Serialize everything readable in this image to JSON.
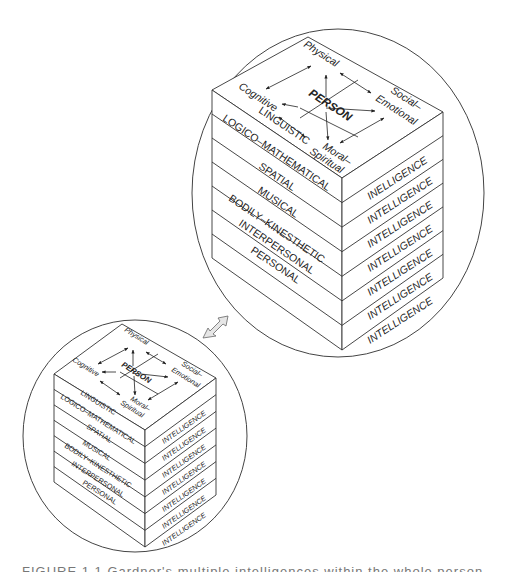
{
  "figure": {
    "layers": [
      "LINGUISTIC",
      "LOGICO–MATHEMATICAL",
      "SPATIAL",
      "MUSICAL",
      "BODILY–KINESTHETIC",
      "INTERPERSONAL",
      "PERSONAL"
    ],
    "right_labels": [
      "INELLIGENCE",
      "INTELLIGENCE",
      "INTELLIGENCE",
      "INTELLIGENCE",
      "INTELLIGENCE",
      "INTELLIGENCE",
      "INTELLIGENCE"
    ],
    "small_right_labels": [
      "INTELLIGENCE",
      "INTELLIGENCE",
      "INTELLIGENCE",
      "INTELLIGENCE",
      "INTELLIGENCE",
      "INTELLIGENCE",
      "INTELLIGENCE"
    ],
    "top": {
      "center": "PERSON",
      "physical": "Physical",
      "social": "Social–",
      "emotional": "Emotional",
      "cognitive": "Cognitive",
      "moral": "Moral–",
      "spiritual": "Spiritual"
    },
    "connector_icon": "double-arrow-icon"
  },
  "caption": {
    "text": "FIGURE 1.1  Gardner's multiple intelligences within the whole person"
  },
  "colors": {
    "line": "#333333",
    "arrow_fill": "#e6e6e6",
    "background": "#ffffff"
  }
}
